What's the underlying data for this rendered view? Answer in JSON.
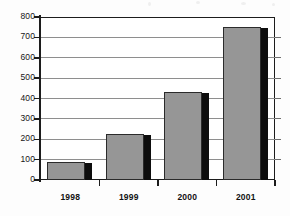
{
  "chart_data": {
    "type": "bar",
    "title": "",
    "subtitle": "",
    "xlabel": "",
    "ylabel": "",
    "categories": [
      "1998",
      "1999",
      "2000",
      "2001"
    ],
    "values": [
      90,
      225,
      430,
      750
    ],
    "series": [
      {
        "name": "",
        "values": [
          90,
          225,
          430,
          750
        ]
      }
    ],
    "ylim": [
      0,
      800
    ],
    "ytick_values": [
      0,
      100,
      200,
      300,
      400,
      500,
      600,
      700,
      800
    ],
    "ytick_labels": [
      "0",
      "100",
      "200",
      "300",
      "400",
      "500",
      "600",
      "700",
      "800"
    ],
    "grid": true,
    "legend": false,
    "legend_position": "none",
    "annotations": [],
    "colors": {
      "bar_fill": "#969696",
      "bar_outline": "#2b2b2b",
      "bar_shadow": "#0d0d0d",
      "axis": "#1c1c1c",
      "gridline": "#8e8e8e",
      "plot_background": "#ffffff",
      "page_background": "#fdfdfd",
      "text": "#121212"
    }
  }
}
